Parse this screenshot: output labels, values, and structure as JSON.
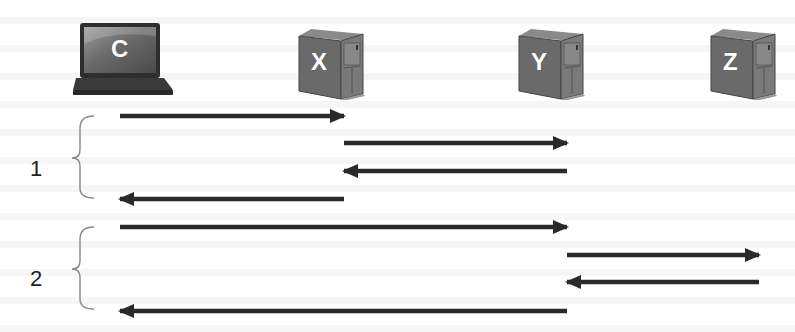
{
  "diagram": {
    "type": "sequence-diagram",
    "colors": {
      "arrow": "#2a2a2a",
      "brace": "#888888",
      "device_body": "#6e6e6e",
      "device_dark": "#3a3a3a",
      "label_text": "#ffffff"
    },
    "nodes": [
      {
        "id": "C",
        "label": "C",
        "kind": "laptop-icon",
        "x": 123
      },
      {
        "id": "X",
        "label": "X",
        "kind": "server-icon",
        "x": 331
      },
      {
        "id": "Y",
        "label": "Y",
        "kind": "server-icon",
        "x": 550
      },
      {
        "id": "Z",
        "label": "Z",
        "kind": "server-icon",
        "x": 741
      }
    ],
    "phases": [
      {
        "label": "1",
        "messages": [
          {
            "from": "C",
            "to": "X",
            "y": 116
          },
          {
            "from": "X",
            "to": "Y",
            "y": 143
          },
          {
            "from": "Y",
            "to": "X",
            "y": 171
          },
          {
            "from": "X",
            "to": "C",
            "y": 199
          }
        ]
      },
      {
        "label": "2",
        "messages": [
          {
            "from": "C",
            "to": "Y",
            "y": 227
          },
          {
            "from": "Y",
            "to": "Z",
            "y": 255
          },
          {
            "from": "Z",
            "to": "Y",
            "y": 282
          },
          {
            "from": "Y",
            "to": "C",
            "y": 311
          }
        ]
      }
    ]
  }
}
